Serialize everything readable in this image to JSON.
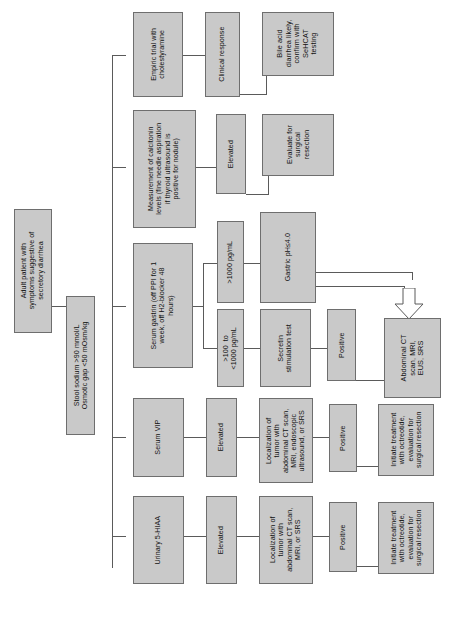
{
  "diagram": {
    "orientation": "rotated-90",
    "node_fill": "#c9c9c9",
    "node_border": "#6e6e6e",
    "connector_color": "#5a5a5a"
  },
  "nodes": {
    "start": "Adult patient with\nsymptoms suggestive of\nsecretory diarrhea",
    "criteria": "Stool sodium >90 mmol/L\nOsmotic gap <50 mOsm/kg",
    "cholestyramine": "Empiric trial with\ncholestyramine",
    "clinical_response": "Clinical response",
    "bile_acid": "Bile acid\ndiarrhea likely,\nconfirm with\nSeHCAT\ntesting",
    "calcitonin": "Measurement of calcitonin\nlevels (fine needle aspiration\nif thyroid ultrasound is\npositive for nodule)",
    "calcitonin_elevated": "Elevated",
    "surgical_resection": "Evaluate for\nsurgical\nresection",
    "gastrin": "Serum gastrin (off PPI for 1\nweek, off H2-blocker 48\nhours)",
    "gastrin_high": ">1000 pg/mL",
    "gastric_ph": "Gastric pH≤4.0",
    "gastrin_mid": ">100  to\n<1000 pg/mL",
    "secretin": "Secretin\nstimulation test",
    "secretin_positive": "Positive",
    "abdominal_ct": "Abdominal CT\nscan, MRI,\nEUS, SRS",
    "vip": "Serum VIP",
    "vip_elevated": "Elevated",
    "vip_localization": "Localization of\ntumor with\nabdominal CT scan,\nMRI, endoscopic\nultrasound, or SRS",
    "vip_positive": "Positive",
    "vip_treatment": "Initiate treatment\nwith octreotide,\nevaluation for\nsurgical resection",
    "hiaa": "Urinary 5-HIAA",
    "hiaa_elevated": "Elevated",
    "hiaa_localization": "Localization of\ntumor with\nabdominal CT scan,\nMRI, or SRS",
    "hiaa_positive": "Positive",
    "hiaa_treatment": "Initiate treatment\nwith octreotide,\nevaluation for\nsurgical resection"
  }
}
